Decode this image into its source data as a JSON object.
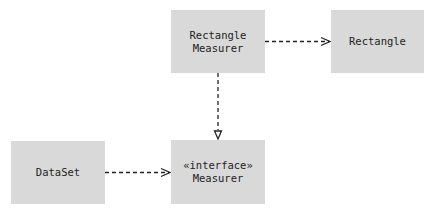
{
  "diagram": {
    "nodes": [
      {
        "id": "rectangle-measurer",
        "lines": [
          "Rectangle",
          "Measurer"
        ]
      },
      {
        "id": "rectangle",
        "lines": [
          "Rectangle"
        ]
      },
      {
        "id": "dataset",
        "lines": [
          "DataSet"
        ]
      },
      {
        "id": "measurer",
        "lines": [
          "«interface»",
          "Measurer"
        ]
      }
    ],
    "edges": [
      {
        "from": "rectangle-measurer",
        "to": "rectangle",
        "type": "dependency",
        "style": "dashed",
        "arrow": "open"
      },
      {
        "from": "rectangle-measurer",
        "to": "measurer",
        "type": "realization",
        "style": "dashed",
        "arrow": "hollow-triangle"
      },
      {
        "from": "dataset",
        "to": "measurer",
        "type": "dependency",
        "style": "dashed",
        "arrow": "open"
      }
    ],
    "colors": {
      "box_fill": "#d9d9d9",
      "line": "#222222",
      "text": "#222222"
    }
  }
}
